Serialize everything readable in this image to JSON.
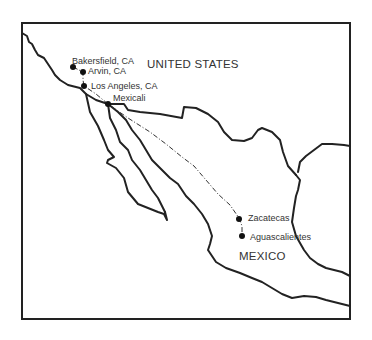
{
  "map": {
    "countries": [
      {
        "name": "UNITED STATES"
      },
      {
        "name": "MEXICO"
      }
    ],
    "cities": [
      {
        "name": "Bakersfield, CA"
      },
      {
        "name": "Arvin, CA"
      },
      {
        "name": "Los Angeles, CA"
      },
      {
        "name": "Mexicali"
      },
      {
        "name": "Zacatecas"
      },
      {
        "name": "Aguascalientes"
      }
    ],
    "colors": {
      "line": "#222222",
      "text": "#333333",
      "background": "#ffffff"
    },
    "route_style": "dash-dot"
  }
}
